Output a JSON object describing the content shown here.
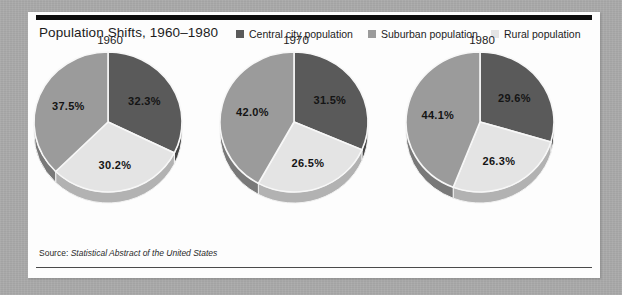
{
  "card": {
    "title": "Population Shifts, 1960–1980",
    "source_label": "Source:",
    "source_title": "Statistical Abstract of the United States"
  },
  "legend": {
    "items": [
      {
        "label": "Central city population",
        "color": "#5a5a5a",
        "key": "central-city"
      },
      {
        "label": "Suburban population",
        "color": "#9b9b9b",
        "key": "suburban"
      },
      {
        "label": "Rural population",
        "color": "#e4e4e4",
        "key": "rural"
      }
    ]
  },
  "chart_data": {
    "type": "pie",
    "title": "Population Shifts, 1960–1980",
    "subtitle": "",
    "xlabel": "",
    "ylabel": "",
    "legend_position": "top-right",
    "grid": false,
    "units": "percent",
    "source": "Statistical Abstract of the United States",
    "categories": [
      "Central city population",
      "Suburban population",
      "Rural population"
    ],
    "colors": [
      "#5a5a5a",
      "#9b9b9b",
      "#e4e4e4"
    ],
    "charts": [
      {
        "year": "1960",
        "slices": [
          {
            "category": "Central city population",
            "value": 32.3,
            "label": "32.3%"
          },
          {
            "category": "Rural population",
            "value": 30.2,
            "label": "30.2%"
          },
          {
            "category": "Suburban population",
            "value": 37.5,
            "label": "37.5%"
          }
        ]
      },
      {
        "year": "1970",
        "slices": [
          {
            "category": "Central city population",
            "value": 31.5,
            "label": "31.5%"
          },
          {
            "category": "Rural population",
            "value": 26.5,
            "label": "26.5%"
          },
          {
            "category": "Suburban population",
            "value": 42.0,
            "label": "42.0%"
          }
        ]
      },
      {
        "year": "1980",
        "slices": [
          {
            "category": "Central city population",
            "value": 29.6,
            "label": "29.6%"
          },
          {
            "category": "Rural population",
            "value": 26.3,
            "label": "26.3%"
          },
          {
            "category": "Suburban population",
            "value": 44.1,
            "label": "44.1%"
          }
        ]
      }
    ]
  }
}
